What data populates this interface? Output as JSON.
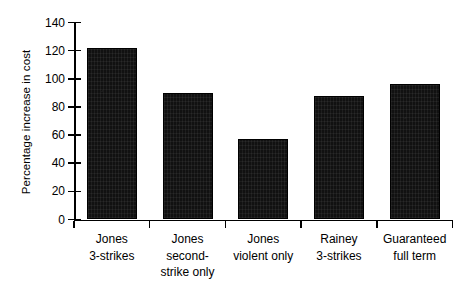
{
  "chart_data": {
    "type": "bar",
    "title": "",
    "xlabel": "",
    "ylabel": "Percentage increase in cost",
    "categories": [
      "Jones 3-strikes",
      "Jones second-strike only",
      "Jones violent only",
      "Rainey 3-strikes",
      "Guaranteed full term"
    ],
    "category_lines": [
      [
        "Jones",
        "3-strikes"
      ],
      [
        "Jones",
        "second-",
        "strike only"
      ],
      [
        "Jones",
        "violent only"
      ],
      [
        "Rainey",
        "3-strikes"
      ],
      [
        "Guaranteed",
        "full term"
      ]
    ],
    "values": [
      122,
      90,
      57,
      88,
      96
    ],
    "ylim": [
      0,
      140
    ],
    "ytick_values": [
      0,
      20,
      40,
      60,
      80,
      100,
      120,
      140
    ],
    "ytick_labels": [
      "0",
      "20",
      "40",
      "60",
      "80",
      "100",
      "120",
      "140"
    ],
    "grid": false,
    "legend": false,
    "legend_position": "none",
    "bar_color": "#111111",
    "axis_color": "#000000"
  }
}
